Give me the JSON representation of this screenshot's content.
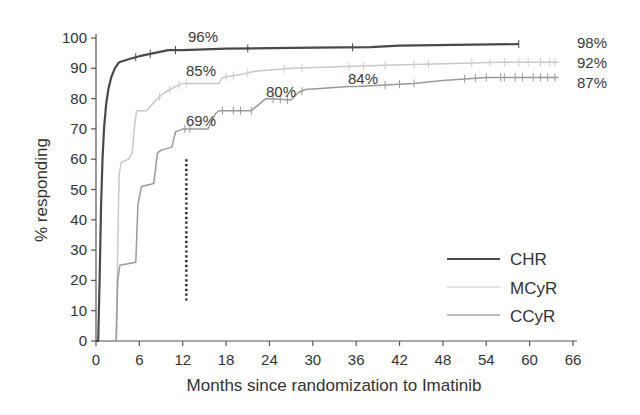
{
  "chart_data": {
    "type": "line",
    "subtype": "kaplan-meier step curves (cumulative response)",
    "title": "",
    "xlabel": "Months since randomization to Imatinib",
    "ylabel": "% responding",
    "xlim": [
      0,
      66
    ],
    "ylim": [
      0,
      100
    ],
    "x_ticks": [
      0,
      6,
      12,
      18,
      24,
      30,
      36,
      42,
      48,
      54,
      60,
      66
    ],
    "y_ticks": [
      0,
      10,
      20,
      30,
      40,
      50,
      60,
      70,
      80,
      90,
      100
    ],
    "grid": false,
    "legend_position": "lower right",
    "series": [
      {
        "name": "CHR",
        "color": "#4a4a4a",
        "width": 2.2,
        "points": [
          [
            0,
            0
          ],
          [
            0.3,
            0
          ],
          [
            0.5,
            20
          ],
          [
            0.7,
            45
          ],
          [
            0.9,
            60
          ],
          [
            1.1,
            70
          ],
          [
            1.4,
            78
          ],
          [
            1.7,
            83
          ],
          [
            2.1,
            87
          ],
          [
            2.6,
            90
          ],
          [
            3.2,
            92
          ],
          [
            4.5,
            93
          ],
          [
            6,
            94
          ],
          [
            8,
            95
          ],
          [
            10,
            96
          ],
          [
            12,
            96
          ],
          [
            18,
            96.5
          ],
          [
            30,
            96.8
          ],
          [
            38,
            97
          ],
          [
            42,
            97.5
          ],
          [
            58.5,
            98
          ]
        ],
        "censor_marks": [
          5.5,
          7.5,
          11,
          21,
          35.5,
          58.5
        ],
        "final_label": "98%"
      },
      {
        "name": "MCyR",
        "color": "#c9c9c9",
        "width": 1.5,
        "points": [
          [
            0,
            0
          ],
          [
            2.8,
            0
          ],
          [
            3,
            30
          ],
          [
            3.2,
            55
          ],
          [
            3.5,
            59
          ],
          [
            4.5,
            60
          ],
          [
            5,
            62
          ],
          [
            5.3,
            70
          ],
          [
            5.6,
            76
          ],
          [
            7,
            76
          ],
          [
            8.5,
            80
          ],
          [
            9.5,
            82
          ],
          [
            11,
            84
          ],
          [
            12,
            85
          ],
          [
            17,
            85
          ],
          [
            17.5,
            87
          ],
          [
            20,
            88
          ],
          [
            22,
            89
          ],
          [
            27,
            90
          ],
          [
            40,
            91
          ],
          [
            56,
            92
          ],
          [
            64,
            92
          ]
        ],
        "censor_marks": [
          8.8,
          10.2,
          11.5,
          12.5,
          18,
          19,
          21,
          26,
          28.5,
          35,
          37,
          40,
          44,
          46,
          52,
          54.5,
          56.5,
          58.5,
          59.8,
          61.5,
          62.8,
          63.5
        ],
        "final_label": "92%"
      },
      {
        "name": "CCyR",
        "color": "#9a9a9a",
        "width": 1.5,
        "points": [
          [
            0,
            0
          ],
          [
            2.8,
            0
          ],
          [
            3,
            20
          ],
          [
            3.3,
            25
          ],
          [
            5.5,
            26
          ],
          [
            5.8,
            45
          ],
          [
            6.3,
            51
          ],
          [
            8,
            52
          ],
          [
            8.5,
            62
          ],
          [
            9,
            63
          ],
          [
            10.5,
            64
          ],
          [
            11,
            69
          ],
          [
            12,
            70
          ],
          [
            15.5,
            70
          ],
          [
            16.5,
            75
          ],
          [
            17,
            76
          ],
          [
            21.5,
            76
          ],
          [
            22.5,
            78
          ],
          [
            23.5,
            80
          ],
          [
            27,
            79.5
          ],
          [
            28,
            82
          ],
          [
            29,
            83
          ],
          [
            35,
            84
          ],
          [
            36,
            84
          ],
          [
            44,
            85
          ],
          [
            48,
            86
          ],
          [
            54,
            87
          ],
          [
            64,
            87
          ]
        ],
        "censor_marks": [
          12.3,
          13,
          17.5,
          19,
          20,
          21.5,
          24.5,
          25.5,
          26.5,
          28.5,
          40,
          42,
          44,
          51,
          52.5,
          54,
          56,
          56.5,
          58,
          59,
          60.5,
          61.5,
          62.5,
          63.5
        ],
        "final_label": "87%"
      }
    ],
    "annotations": [
      {
        "text": "96%",
        "x": 12,
        "y": 96,
        "series": "CHR"
      },
      {
        "text": "85%",
        "x": 12,
        "y": 85,
        "series": "MCyR"
      },
      {
        "text": "69%",
        "x": 12,
        "y": 69,
        "series": "CCyR"
      },
      {
        "text": "80%",
        "x": 24,
        "y": 80,
        "series": "CCyR"
      },
      {
        "text": "84%",
        "x": 36,
        "y": 84,
        "series": "CCyR"
      },
      {
        "text": "98%",
        "x": 66,
        "y": 98,
        "series": "CHR"
      },
      {
        "text": "92%",
        "x": 66,
        "y": 92,
        "series": "MCyR"
      },
      {
        "text": "87%",
        "x": 66,
        "y": 87,
        "series": "CCyR"
      }
    ],
    "reference_line": {
      "style": "dotted",
      "x": 12.5,
      "y_from": 13,
      "y_to": 60,
      "color": "#2a2a2a"
    }
  },
  "legend": {
    "items": [
      {
        "label": "CHR",
        "color": "#4a4a4a"
      },
      {
        "label": "MCyR",
        "color": "#d8d8d8"
      },
      {
        "label": "CCyR",
        "color": "#a8a8a8"
      }
    ]
  }
}
